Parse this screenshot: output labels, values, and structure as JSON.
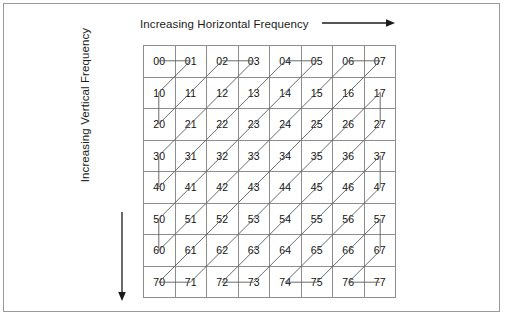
{
  "figure": {
    "title_h_axis": "Increasing Horizontal Frequency",
    "title_v_axis": "Increasing Vertical Frequency",
    "h_arrow_icon": "arrow-right-icon",
    "v_arrow_icon": "arrow-down-icon",
    "grid_rows": 8,
    "grid_cols": 8,
    "colors": {
      "frame": "#9a9a9a",
      "grid_line": "#8d8d8d",
      "zigzag_line": "#5a5a5a",
      "text": "#111111",
      "background": "#ffffff"
    }
  },
  "chart_data": {
    "type": "table",
    "xlabel": "Increasing Horizontal Frequency",
    "ylabel": "Increasing Vertical Frequency",
    "rows": 8,
    "cols": 8,
    "cell_labels": [
      [
        "00",
        "01",
        "02",
        "03",
        "04",
        "05",
        "06",
        "07"
      ],
      [
        "10",
        "11",
        "12",
        "13",
        "14",
        "15",
        "16",
        "17"
      ],
      [
        "20",
        "21",
        "22",
        "23",
        "24",
        "25",
        "26",
        "27"
      ],
      [
        "30",
        "31",
        "32",
        "33",
        "34",
        "35",
        "36",
        "37"
      ],
      [
        "40",
        "41",
        "42",
        "43",
        "44",
        "45",
        "46",
        "47"
      ],
      [
        "50",
        "51",
        "52",
        "53",
        "54",
        "55",
        "56",
        "57"
      ],
      [
        "60",
        "61",
        "62",
        "63",
        "64",
        "65",
        "66",
        "67"
      ],
      [
        "70",
        "71",
        "72",
        "73",
        "74",
        "75",
        "76",
        "77"
      ]
    ],
    "scan_order": [
      "00",
      "01",
      "10",
      "20",
      "11",
      "02",
      "03",
      "12",
      "21",
      "30",
      "40",
      "31",
      "22",
      "13",
      "04",
      "05",
      "14",
      "23",
      "32",
      "41",
      "50",
      "60",
      "51",
      "42",
      "33",
      "24",
      "15",
      "06",
      "07",
      "16",
      "25",
      "34",
      "43",
      "52",
      "61",
      "70",
      "71",
      "62",
      "53",
      "44",
      "35",
      "26",
      "17",
      "27",
      "36",
      "45",
      "54",
      "63",
      "72",
      "73",
      "64",
      "55",
      "46",
      "37",
      "47",
      "56",
      "65",
      "74",
      "75",
      "66",
      "57",
      "67",
      "76",
      "77"
    ],
    "grid": true,
    "legend": "none"
  }
}
